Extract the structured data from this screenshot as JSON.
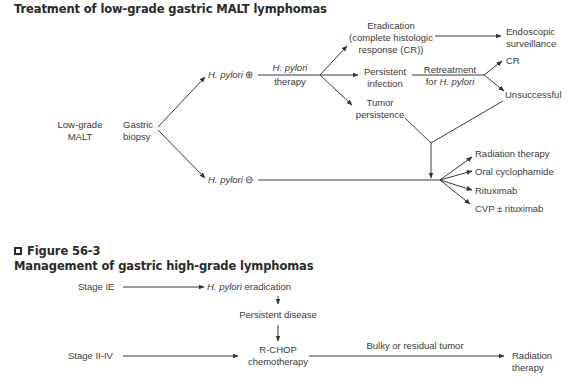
{
  "figure1": {
    "title": "Treatment of low-grade gastric MALT lymphomas",
    "nodes": {
      "low_grade_malt_1": "Low-grade",
      "low_grade_malt_2": "MALT",
      "gastric_biopsy_1": "Gastric",
      "gastric_biopsy_2": "biopsy",
      "hp_pos_italic": "H. pylori",
      "hp_pos_sign": " ⊕",
      "hp_therapy_italic": "H. pylori",
      "hp_therapy_2": "therapy",
      "eradication_1": "Eradication",
      "eradication_2": "(complete histologic",
      "eradication_3": "response (CR))",
      "endoscopic_1": "Endoscopic",
      "endoscopic_2": "surveillance",
      "persistent_1": "Persistent",
      "persistent_2": "infection",
      "retreatment_1": "Retreatment",
      "retreatment_2_prefix": "for ",
      "retreatment_2_italic": "H. pylori",
      "cr": "CR",
      "unsuccessful": "Unsuccessful",
      "tumor_1": "Tumor",
      "tumor_2": "persistence",
      "hp_neg_italic": "H. pylori",
      "hp_neg_sign": " ⊖"
    },
    "options": [
      "Radiation therapy",
      "Oral cyclophamide",
      "Rituximab",
      "CVP ± rituximab"
    ]
  },
  "figure2": {
    "label": "Figure 56-3",
    "title": "Management of gastric high-grade lymphomas",
    "nodes": {
      "stage_ie": "Stage IE",
      "hp_erad_italic": "H. pylori",
      "hp_erad_rest": " eradication",
      "persistent_disease": "Persistent disease",
      "stage_ii_iv": "Stage II-IV",
      "rchop_1": "R-CHOP",
      "rchop_2": "chemotherapy",
      "bulky": "Bulky or residual tumor",
      "radiation_1": "Radiation",
      "radiation_2": "therapy"
    }
  },
  "colors": {
    "line": "#3a3a3a",
    "text": "#3a3a3a",
    "title": "#2a2a2a"
  }
}
